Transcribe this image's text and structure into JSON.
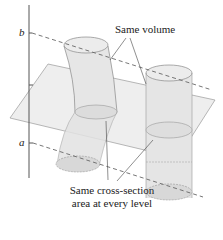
{
  "diagram": {
    "type": "3d-solids-illustration",
    "axis_labels": {
      "top": "b",
      "bottom": "a"
    },
    "annotations": {
      "top": "Same volume",
      "bottom_line1": "Same cross-section",
      "bottom_line2": "area at every level"
    },
    "solids": [
      {
        "name": "slanted-cylinder",
        "description": "oblique curved cylinder on left"
      },
      {
        "name": "right-cylinder",
        "description": "upright circular cylinder on right"
      }
    ],
    "elements": [
      "vertical-axis",
      "horizontal-cutting-plane",
      "dashed-level-line-b",
      "dashed-level-line-a"
    ],
    "colors": {
      "line": "#555555",
      "fill": "#e6e6e6",
      "plane": "#eeeeee",
      "ink": "#222222"
    }
  }
}
